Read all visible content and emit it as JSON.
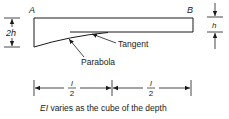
{
  "diagram": {
    "type": "tapered-beam",
    "labels": {
      "end_left": "A",
      "end_right": "B",
      "depth_left": "2h",
      "depth_right": "h",
      "tangent": "Tangent",
      "parabola": "Parabola",
      "span_left_num": "l",
      "span_left_den": "2",
      "span_right_num": "l",
      "span_right_den": "2"
    },
    "caption": "EI varies as the cube of the depth",
    "caption_parts": {
      "symbol": "EI",
      "text": " varies as the cube of the depth"
    },
    "colors": {
      "line": "#1a1a1a",
      "background": "#ffffff"
    }
  }
}
